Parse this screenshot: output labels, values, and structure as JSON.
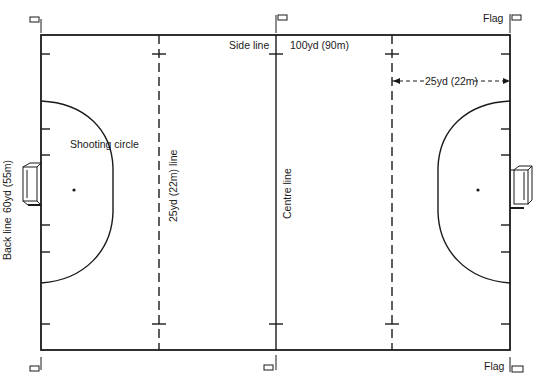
{
  "diagram": {
    "colors": {
      "line": "#1a1a1a",
      "background": "#ffffff"
    },
    "field": {
      "left": 41,
      "top": 35,
      "right": 510,
      "bottom": 350
    },
    "labels": {
      "side_line": "Side line",
      "length": "100yd (90m)",
      "quarter_distance": "25yd (22m)",
      "shooting_circle": "Shooting circle",
      "quarter_line": "25yd (22m) line",
      "centre_line": "Centre line",
      "back_line": "Back line",
      "width": "60yd (55m)",
      "flag_top": "Flag",
      "flag_bottom": "Flag"
    },
    "icons": [
      "flag-icon",
      "goal-icon",
      "penalty-spot-icon",
      "arrow-icon"
    ]
  }
}
